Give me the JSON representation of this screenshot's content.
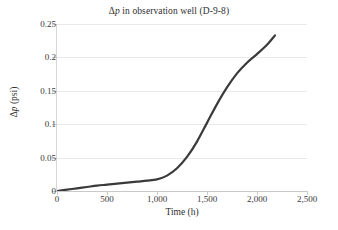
{
  "chart_data": {
    "type": "line",
    "title": "Δp in observation well (D-9-8)",
    "title_prefix": "Δ",
    "title_italic": "p",
    "title_suffix": " in observation well (D-9-8)",
    "xlabel": "Time (h)",
    "ylabel": "Δp (psi)",
    "ylabel_prefix": "Δ",
    "ylabel_italic": "p",
    "ylabel_suffix": " (psi)",
    "xlim": [
      0,
      2500
    ],
    "ylim": [
      0,
      0.25
    ],
    "xticks": [
      0,
      500,
      1000,
      1500,
      2000,
      2500
    ],
    "xticklabels": [
      "0",
      "500",
      "1,000",
      "1,500",
      "2,000",
      "2,500"
    ],
    "yticks": [
      0,
      0.05,
      0.1,
      0.15,
      0.2,
      0.25
    ],
    "yticklabels": [
      "0",
      "0.05",
      "0.1",
      "0.15",
      "0.2",
      "0.25"
    ],
    "grid": "horizontal",
    "legend": null,
    "series": [
      {
        "name": "Δp",
        "color": "#3a3a3a",
        "linewidth": 2.2,
        "x": [
          0,
          100,
          200,
          300,
          400,
          500,
          600,
          700,
          800,
          900,
          1000,
          1100,
          1200,
          1300,
          1400,
          1500,
          1600,
          1700,
          1800,
          1900,
          2000,
          2100,
          2180
        ],
        "y": [
          0.0,
          0.002,
          0.004,
          0.006,
          0.008,
          0.0095,
          0.011,
          0.0125,
          0.014,
          0.0155,
          0.0175,
          0.023,
          0.034,
          0.051,
          0.074,
          0.102,
          0.13,
          0.155,
          0.176,
          0.192,
          0.205,
          0.219,
          0.233
        ]
      }
    ]
  },
  "axes_geometry": {
    "plot_left": 57,
    "plot_top": 24,
    "plot_width": 250,
    "plot_height": 167
  },
  "colors": {
    "line": "#3a3a3a",
    "grid": "#e9e9e9",
    "axis": "#c9c9c9",
    "text": "#3a3a3a",
    "background": "#ffffff"
  }
}
